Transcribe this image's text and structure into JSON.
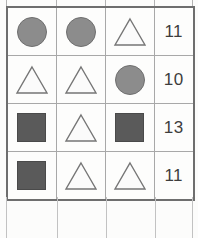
{
  "page": {
    "background_color": "#fcfcfb",
    "border_color": "#6e6e6e",
    "gridline_color": "#a8a8a8"
  },
  "table": {
    "name": "shape-count-grid",
    "column_count": 4,
    "row_count": 4,
    "shape_columns": 3,
    "has_header": false,
    "colors": {
      "circle_fill": "#8c8c8c",
      "circle_stroke": "#6f6f6f",
      "square_fill": "#5a5a5a",
      "square_stroke": "#4a4a4a",
      "triangle_fill": "#fbfbfb",
      "triangle_stroke": "#767676",
      "number_text": "#3d3d3d"
    },
    "icon_names": {
      "circle": "circle-shape-icon",
      "square": "square-shape-icon",
      "triangle": "triangle-shape-icon"
    },
    "rows": [
      {
        "shapes": [
          "circle",
          "circle",
          "triangle"
        ],
        "value": "11"
      },
      {
        "shapes": [
          "triangle",
          "triangle",
          "circle"
        ],
        "value": "10"
      },
      {
        "shapes": [
          "square",
          "triangle",
          "square"
        ],
        "value": "13"
      },
      {
        "shapes": [
          "square",
          "triangle",
          "triangle"
        ],
        "value": "11"
      }
    ]
  },
  "top_sliver": {
    "visible": true,
    "description": "clipped row above table"
  },
  "bottom_partial_row": {
    "visible": true,
    "empty": true,
    "description": "empty partial row below table"
  }
}
